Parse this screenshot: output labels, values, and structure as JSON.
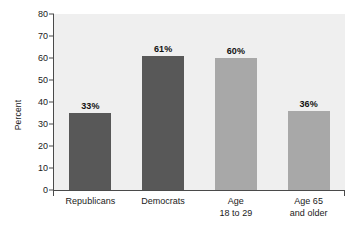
{
  "chart_data": {
    "type": "bar",
    "title": "",
    "subtitle": "",
    "xlabel": "",
    "ylabel": "Percent",
    "ylim": [
      0,
      80
    ],
    "ytick_step": 10,
    "grid": false,
    "legend": "none",
    "categories": [
      "Republicans",
      "Age\n18 to 29",
      "Democrats",
      "Age 65\nand older"
    ],
    "bars": [
      {
        "category_lines": [
          "Republicans"
        ],
        "value": 33,
        "value_label": "33%",
        "bar_top": 35,
        "color": "#585858"
      },
      {
        "category_lines": [
          "Democrats"
        ],
        "value": 61,
        "value_label": "61%",
        "bar_top": 61,
        "color": "#585858"
      },
      {
        "category_lines": [
          "Age",
          "18 to 29"
        ],
        "value": 60,
        "value_label": "60%",
        "bar_top": 60,
        "color": "#a8a8a8"
      },
      {
        "category_lines": [
          "Age 65",
          "and older"
        ],
        "value": 36,
        "value_label": "36%",
        "bar_top": 36,
        "color": "#a8a8a8"
      }
    ],
    "ytick_labels": [
      "0",
      "10",
      "20",
      "30",
      "40",
      "50",
      "60",
      "70",
      "80"
    ],
    "ytick_values": [
      0,
      10,
      20,
      30,
      40,
      50,
      60,
      70,
      80
    ]
  },
  "colors": {
    "bar_dark": "#585858",
    "bar_light": "#a8a8a8",
    "plot_background": "#efefef",
    "page_background": "#ffffff",
    "axis": "#4a4a4a",
    "text": "#1a1a1a"
  }
}
